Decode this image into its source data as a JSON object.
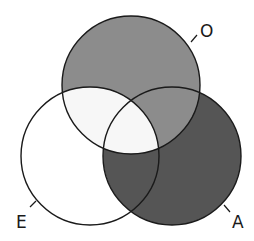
{
  "diagram": {
    "type": "venn-3",
    "sets": [
      {
        "id": "O",
        "label": "O",
        "cx": 131,
        "cy": 85,
        "r": 69
      },
      {
        "id": "E",
        "label": "E",
        "cx": 90,
        "cy": 156,
        "r": 69
      },
      {
        "id": "A",
        "label": "A",
        "cx": 172,
        "cy": 156,
        "r": 69
      }
    ],
    "regions": {
      "O_only": "#8c8c8c",
      "A_only": "#555555",
      "E_only": "#ffffff",
      "O_and_E": "#f7f7f7",
      "O_and_A": "#8c8c8c",
      "E_and_A": "#555555",
      "O_E_A": "#f7f7f7"
    },
    "stroke_color": "#1a1a1a",
    "background": "#ffffff"
  }
}
